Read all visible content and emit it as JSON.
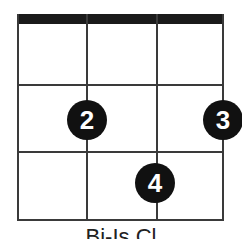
{
  "chord_diagram": {
    "strings": 4,
    "frets_shown": 3,
    "nut_visible": true,
    "fingers": [
      {
        "finger": "2",
        "string": 2,
        "fret": 2
      },
      {
        "finger": "3",
        "string": 4,
        "fret": 2
      },
      {
        "finger": "4",
        "string": 3,
        "fret": 3
      }
    ],
    "label": "Bi-Is Cl",
    "colors": {
      "lines": "#3a3a3a",
      "nut": "#1a1a1a",
      "dot": "#111111",
      "dot_text": "#ffffff"
    }
  }
}
